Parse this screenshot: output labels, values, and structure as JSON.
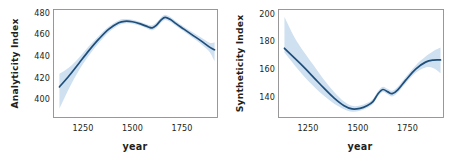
{
  "figure": {
    "width": 453,
    "height": 156,
    "background": "#ffffff",
    "panel_count": 2
  },
  "style": {
    "line_color": "#1f4e79",
    "band_color": "#cfe0f1",
    "band_color_inner": "#bcd5ec",
    "spine_color": "#8e8e8e",
    "text_color": "#231f20",
    "line_width": 1.7
  },
  "chart_data": [
    {
      "type": "line",
      "panel": "left",
      "title": "",
      "xlabel": "year",
      "ylabel": "Analyticity Index",
      "xlim": [
        1100,
        1930
      ],
      "ylim": [
        388,
        487
      ],
      "xticks": [
        1250,
        1500,
        1750
      ],
      "xtick_labels": [
        "1250",
        "1500",
        "1750"
      ],
      "yticks": [
        400,
        420,
        440,
        460,
        480
      ],
      "ytick_labels": [
        "400",
        "420",
        "440",
        "460",
        "480"
      ],
      "grid": false,
      "legend": "none",
      "series": [
        {
          "name": "Analyticity Index (smoothed trend)",
          "x": [
            1130,
            1180,
            1230,
            1280,
            1330,
            1380,
            1430,
            1460,
            1500,
            1540,
            1580,
            1600,
            1620,
            1645,
            1665,
            1690,
            1720,
            1760,
            1800,
            1845,
            1890,
            1915
          ],
          "values": [
            416.0,
            426.5,
            438.0,
            449.5,
            460.0,
            469.0,
            474.8,
            476.2,
            475.8,
            473.8,
            471.0,
            470.2,
            472.5,
            477.5,
            479.8,
            478.0,
            474.0,
            469.0,
            464.0,
            458.5,
            452.5,
            450.0
          ]
        }
      ],
      "confidence_band": {
        "level": "95%",
        "upper": [
          428.0,
          434.0,
          443.0,
          453.5,
          463.0,
          471.5,
          477.0,
          478.2,
          477.6,
          475.6,
          473.0,
          472.5,
          475.0,
          480.0,
          482.2,
          480.3,
          476.2,
          471.2,
          466.5,
          461.5,
          456.5,
          457.0
        ],
        "lower": [
          396.0,
          415.0,
          431.5,
          445.0,
          456.5,
          466.2,
          472.5,
          474.2,
          474.0,
          472.0,
          469.0,
          468.0,
          470.0,
          475.0,
          477.4,
          475.7,
          471.8,
          466.8,
          461.5,
          455.5,
          448.0,
          439.5
        ]
      }
    },
    {
      "type": "line",
      "panel": "right",
      "title": "",
      "xlabel": "year",
      "ylabel": "Syntheticity Index",
      "xlim": [
        1100,
        1930
      ],
      "ylim": [
        128,
        206
      ],
      "xticks": [
        1250,
        1500,
        1750
      ],
      "xtick_labels": [
        "1250",
        "1500",
        "1750"
      ],
      "yticks": [
        140,
        160,
        180,
        200
      ],
      "ytick_labels": [
        "140",
        "160",
        "180",
        "200"
      ],
      "grid": false,
      "legend": "none",
      "series": [
        {
          "name": "Syntheticity Index (smoothed trend)",
          "x": [
            1130,
            1180,
            1230,
            1280,
            1330,
            1380,
            1430,
            1470,
            1510,
            1545,
            1575,
            1600,
            1625,
            1650,
            1672,
            1700,
            1740,
            1790,
            1840,
            1880,
            1915
          ],
          "values": [
            178.0,
            171.0,
            164.0,
            156.5,
            149.0,
            142.0,
            136.5,
            134.2,
            134.6,
            136.5,
            139.5,
            145.0,
            148.2,
            146.5,
            145.2,
            148.0,
            155.0,
            163.0,
            168.0,
            169.5,
            169.6
          ]
        }
      ],
      "confidence_band": {
        "level": "95%",
        "upper": [
          200.5,
          186.0,
          175.0,
          165.0,
          155.0,
          146.5,
          139.5,
          136.4,
          136.6,
          138.4,
          141.4,
          147.0,
          150.2,
          148.6,
          147.4,
          150.2,
          157.2,
          165.6,
          172.0,
          176.0,
          178.5
        ],
        "lower": [
          175.0,
          166.0,
          157.5,
          150.0,
          143.5,
          138.0,
          134.0,
          132.2,
          132.8,
          134.8,
          137.8,
          143.2,
          146.4,
          144.6,
          143.2,
          146.0,
          152.8,
          160.4,
          164.2,
          163.5,
          160.0
        ]
      }
    }
  ],
  "panels": {
    "left": {
      "ylabel": "Analyticity Index",
      "xlabel": "year",
      "ytick_labels": [
        "480",
        "460",
        "440",
        "420",
        "400"
      ],
      "xtick_labels": [
        "1250",
        "1500",
        "1750"
      ]
    },
    "right": {
      "ylabel": "Syntheticity Index",
      "xlabel": "year",
      "ytick_labels": [
        "200",
        "180",
        "160",
        "140"
      ],
      "xtick_labels": [
        "1250",
        "1500",
        "1750"
      ]
    }
  }
}
